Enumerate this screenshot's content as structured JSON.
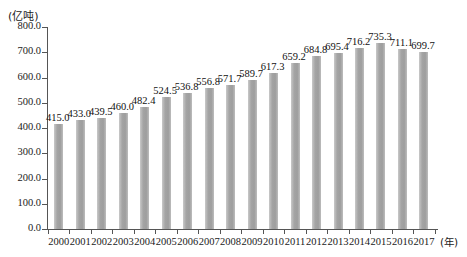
{
  "chart_data": {
    "type": "bar",
    "title": "",
    "subtitle": "",
    "xlabel": "(年)",
    "ylabel": "(亿吨)",
    "categories": [
      "2000",
      "2001",
      "2002",
      "2003",
      "2004",
      "2005",
      "2006",
      "2007",
      "2008",
      "2009",
      "2010",
      "2011",
      "2012",
      "2013",
      "2014",
      "2015",
      "2016",
      "2017"
    ],
    "values": [
      415.0,
      433.0,
      439.5,
      460.0,
      482.4,
      524.5,
      536.8,
      556.8,
      571.7,
      589.7,
      617.3,
      659.2,
      684.8,
      695.4,
      716.2,
      735.3,
      711.1,
      699.7
    ],
    "value_labels": [
      "415.0",
      "433.0",
      "439.5",
      "460.0",
      "482.4",
      "524.5",
      "536.8",
      "556.8",
      "571.7",
      "589.7",
      "617.3",
      "659.2",
      "684.8",
      "695.4",
      "716.2",
      "735.3",
      "711.1",
      "699.7"
    ],
    "ylim": [
      0.0,
      800.0
    ],
    "ytick_values": [
      0.0,
      100.0,
      200.0,
      300.0,
      400.0,
      500.0,
      600.0,
      700.0,
      800.0
    ],
    "ytick_labels": [
      "0.0",
      "100.0",
      "200.0",
      "300.0",
      "400.0",
      "500.0",
      "600.0",
      "700.0",
      "800.0"
    ],
    "grid": false,
    "legend": false,
    "legend_position": "none",
    "series": [
      {
        "name": "",
        "values": [
          415.0,
          433.0,
          439.5,
          460.0,
          482.4,
          524.5,
          536.8,
          556.8,
          571.7,
          589.7,
          617.3,
          659.2,
          684.8,
          695.4,
          716.2,
          735.3,
          711.1,
          699.7
        ]
      }
    ],
    "bar_color": "#a4a4a4",
    "axis_color": "#555555",
    "background_color": "#ffffff"
  }
}
